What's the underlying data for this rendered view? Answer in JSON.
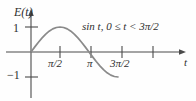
{
  "figure": {
    "background_color": "#fefefe",
    "axis_color": "#4a4a4a",
    "curve_color": "#8a8a8a",
    "text_color": "#2f2f2f"
  },
  "labels": {
    "y_axis": "E(t)",
    "x_axis": "t",
    "y_tick_positive_one": "1",
    "y_tick_negative_one": "−1",
    "x_tick_half_pi": "π/2",
    "x_tick_pi": "π",
    "x_tick_three_half_pi": "3π/2",
    "curve_annotation": "sin t, 0 ≤ t < 3π/2"
  },
  "chart_data": {
    "type": "line",
    "title": "",
    "xlabel": "t",
    "ylabel": "E(t)",
    "grid": false,
    "legend": null,
    "annotations": [
      {
        "text": "sin t, 0 ≤ t < 3π/2",
        "x": 3.3,
        "y": 0.78
      }
    ],
    "xlim": [
      -0.35,
      7.9
    ],
    "ylim": [
      -1.85,
      1.55
    ],
    "xticks": [
      1.5707963,
      3.1415927,
      4.712389,
      6.2831853
    ],
    "xticklabels": [
      "π/2",
      "π",
      "3π/2",
      ""
    ],
    "yticks": [
      -1,
      1
    ],
    "yticklabels": [
      "−1",
      "1"
    ],
    "series": [
      {
        "name": "sin t, 0 ≤ t < 3π/2",
        "color": "#8a8a8a",
        "domain": [
          0,
          4.712389
        ],
        "x": [
          0,
          0.19635,
          0.3927,
          0.58905,
          0.7854,
          0.98175,
          1.1781,
          1.37445,
          1.5707963,
          1.76715,
          1.9635,
          2.15984,
          2.35619,
          2.55254,
          2.74889,
          2.94524,
          3.1415927,
          3.33794,
          3.53429,
          3.73064,
          3.92699,
          4.12334,
          4.31969,
          4.51604,
          4.712389
        ],
        "y": [
          0,
          0.19509,
          0.38268,
          0.55557,
          0.70711,
          0.83147,
          0.92388,
          0.98079,
          1.0,
          0.98079,
          0.92388,
          0.83147,
          0.70711,
          0.55557,
          0.38268,
          0.19509,
          0.0,
          -0.19509,
          -0.38268,
          -0.55557,
          -0.70711,
          -0.83147,
          -0.92388,
          -0.98079,
          -1.0
        ]
      }
    ]
  }
}
